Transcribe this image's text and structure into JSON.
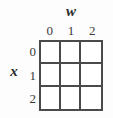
{
  "figure": {
    "type": "table-grid",
    "column_variable_label": "w",
    "row_variable_label": "x",
    "column_headers": [
      "0",
      "1",
      "2"
    ],
    "row_headers": [
      "0",
      "1",
      "2"
    ],
    "cells": [
      [
        "",
        "",
        ""
      ],
      [
        "",
        "",
        ""
      ],
      [
        "",
        "",
        ""
      ]
    ],
    "colors": {
      "background": "#fdfdfd",
      "grid_line": "#4a4a4a",
      "cell_fill": "#ffffff",
      "label_text": "#2b2b2b",
      "header_text": "#3a3a3a"
    }
  }
}
